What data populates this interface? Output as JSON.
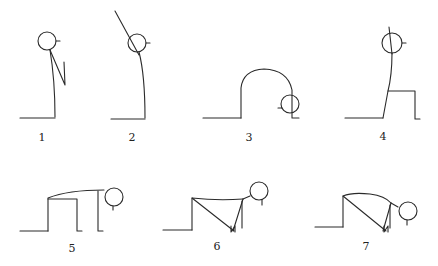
{
  "diagram": {
    "stroke_color": "#2a2a2a",
    "figures": [
      {
        "id": 1,
        "label": "1",
        "pose": "standing, hands at chest"
      },
      {
        "id": 2,
        "label": "2",
        "pose": "standing, arms raised overhead leaning back"
      },
      {
        "id": 3,
        "label": "3",
        "pose": "forward bend, head to knees"
      },
      {
        "id": 4,
        "label": "4",
        "pose": "lunge, one leg back, torso upright"
      },
      {
        "id": 5,
        "label": "5",
        "pose": "kneeling on all fours, head forward"
      },
      {
        "id": 6,
        "label": "6",
        "pose": "lowered plank, chest toward floor"
      },
      {
        "id": 7,
        "label": "7",
        "pose": "forward fold on knees, head down"
      }
    ]
  }
}
